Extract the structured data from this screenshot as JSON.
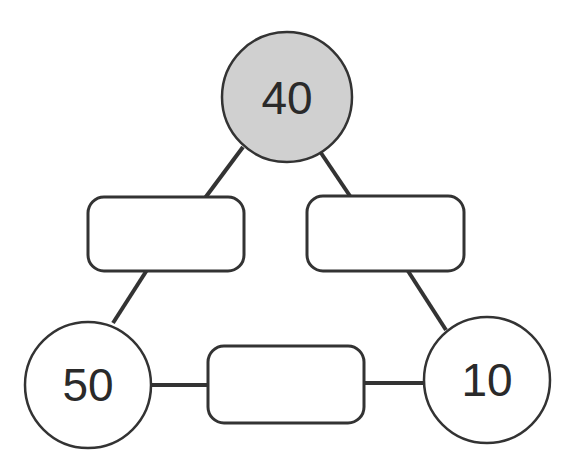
{
  "diagram": {
    "type": "number-triangle",
    "nodes": [
      {
        "id": "top",
        "value": "40",
        "shaded": true
      },
      {
        "id": "bottom-left",
        "value": "50",
        "shaded": false
      },
      {
        "id": "bottom-right",
        "value": "10",
        "shaded": false
      }
    ],
    "boxes": [
      {
        "id": "left-edge-box",
        "value": ""
      },
      {
        "id": "right-edge-box",
        "value": ""
      },
      {
        "id": "bottom-edge-box",
        "value": ""
      }
    ],
    "colors": {
      "stroke": "#333333",
      "shaded_fill": "#d0d0d0",
      "fill": "#ffffff"
    }
  }
}
